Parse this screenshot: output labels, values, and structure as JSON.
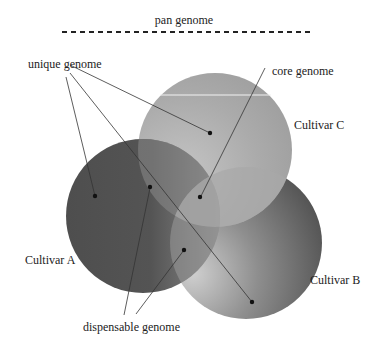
{
  "diagram": {
    "type": "venn",
    "title": "pan genome",
    "labels": {
      "pan_genome": "pan genome",
      "unique_genome": "unique genome",
      "core_genome": "core genome",
      "dispensable_genome": "dispensable genome"
    },
    "sets": [
      {
        "id": "A",
        "label": "Cultivar A",
        "color": "#555555"
      },
      {
        "id": "B",
        "label": "Cultivar B",
        "color": "#5a5a5a"
      },
      {
        "id": "C",
        "label": "Cultivar C",
        "color": "#a9a9a9"
      }
    ],
    "regions": [
      {
        "name": "unique genome",
        "in": [
          "A"
        ]
      },
      {
        "name": "unique genome",
        "in": [
          "B"
        ]
      },
      {
        "name": "unique genome",
        "in": [
          "C"
        ]
      },
      {
        "name": "dispensable genome",
        "in": [
          "A",
          "C"
        ]
      },
      {
        "name": "dispensable genome",
        "in": [
          "A",
          "B"
        ]
      },
      {
        "name": "core genome",
        "in": [
          "A",
          "B",
          "C"
        ]
      }
    ],
    "colors": {
      "background": "#ffffff",
      "text": "#222222",
      "leader_line": "#333333",
      "dot": "#111111"
    }
  }
}
